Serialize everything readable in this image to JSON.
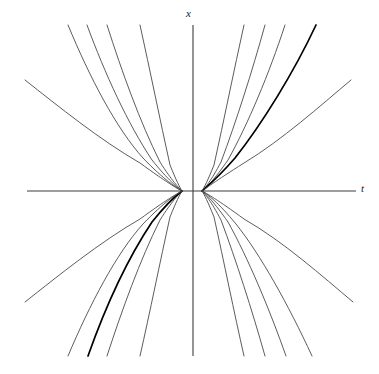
{
  "figure": {
    "title": "",
    "background_color": "#ffffff",
    "width": 379,
    "height": 374
  },
  "axes": {
    "vertical": {
      "label": "x",
      "name": "vertical-axis",
      "x": 193,
      "y_top": 25,
      "y_bottom": 356,
      "color": "#3c3c3c",
      "width": 1.1
    },
    "horizontal": {
      "label": "t",
      "name": "horizontal-axis",
      "y": 191,
      "x_left": 27,
      "x_right": 356,
      "color": "#3c3c3c",
      "width": 1.1
    },
    "origin": {
      "t": 0,
      "x": 0
    }
  },
  "chart_data": {
    "type": "line",
    "title": "",
    "xlabel": "t",
    "ylabel": "x",
    "grid": false,
    "legend": null,
    "pinch_points": [
      {
        "name": "left-pinch",
        "px": 182,
        "py": 191
      },
      {
        "name": "right-pinch",
        "px": 202,
        "py": 191
      }
    ],
    "axis_ranges": {
      "xlim": [
        -4.0,
        4.0
      ],
      "ylim": [
        -4.0,
        4.0
      ]
    },
    "series": [
      {
        "name": "curve-ul-1",
        "quadrant": "upper-left",
        "emphasis": false,
        "c": 0.3,
        "path": "M 140,25 C 150,70 160,120 170,165 C 176,180 180,188 182,191"
      },
      {
        "name": "curve-ul-2",
        "quadrant": "upper-left",
        "emphasis": false,
        "c": 0.55,
        "path": "M 107,25 C 122,72 140,122 160,162 C 172,181 179,188 182,191"
      },
      {
        "name": "curve-ul-3",
        "quadrant": "upper-left",
        "emphasis": false,
        "c": 0.8,
        "path": "M 87,25 C 105,74 128,124 152,160 C 168,180 178,188 182,191"
      },
      {
        "name": "curve-ul-4",
        "quadrant": "upper-left",
        "emphasis": false,
        "c": 1.1,
        "path": "M 68,25 C 90,78 116,128 143,158 C 164,180 177,188 182,191"
      },
      {
        "name": "curve-ul-5",
        "quadrant": "upper-left",
        "emphasis": false,
        "c": 1.9,
        "path": "M 25,80 C 58,106 100,140 140,163 C 166,182 178,189 182,191"
      },
      {
        "name": "curve-ur-1",
        "quadrant": "upper-right",
        "emphasis": false,
        "c": 0.3,
        "path": "M 244,25 C 234,70 224,120 214,165 C 208,180 204,188 202,191"
      },
      {
        "name": "curve-ur-2",
        "quadrant": "upper-right",
        "emphasis": false,
        "c": 0.55,
        "path": "M 265,25 C 252,72 236,122 221,162 C 211,181 205,188 202,191"
      },
      {
        "name": "curve-ur-3",
        "quadrant": "upper-right",
        "emphasis": false,
        "c": 0.8,
        "path": "M 285,25 C 269,74 248,124 228,160 C 214,180 206,188 202,191"
      },
      {
        "name": "curve-ur-4",
        "quadrant": "upper-right",
        "emphasis": true,
        "c": 1.05,
        "path": "M 316,25 C 294,72 262,124 235,158 C 216,180 205,188 202,191"
      },
      {
        "name": "curve-ur-5",
        "quadrant": "upper-right",
        "emphasis": false,
        "c": 1.9,
        "path": "M 351,80 C 320,106 282,140 244,163 C 214,182 205,189 202,191"
      },
      {
        "name": "curve-ll-1",
        "quadrant": "lower-left",
        "emphasis": false,
        "c": 0.3,
        "path": "M 182,191 C 180,194 176,202 170,217 C 160,262 150,312 140,356"
      },
      {
        "name": "curve-ll-2",
        "quadrant": "lower-left",
        "emphasis": false,
        "c": 0.55,
        "path": "M 182,191 C 179,194 172,201 160,220 C 140,260 122,310 107,356"
      },
      {
        "name": "curve-ll-3",
        "quadrant": "lower-left",
        "emphasis": true,
        "c": 0.78,
        "path": "M 182,191 C 178,194 168,202 152,222 C 128,258 105,308 88,356"
      },
      {
        "name": "curve-ll-4",
        "quadrant": "lower-left",
        "emphasis": false,
        "c": 1.1,
        "path": "M 182,191 C 177,194 164,202 143,224 C 116,254 90,304 68,356"
      },
      {
        "name": "curve-ll-5",
        "quadrant": "lower-left",
        "emphasis": false,
        "c": 1.9,
        "path": "M 182,191 C 178,193 166,200 140,219 C 100,242 58,276 25,302"
      },
      {
        "name": "curve-lr-1",
        "quadrant": "lower-right",
        "emphasis": false,
        "c": 0.3,
        "path": "M 202,191 C 204,194 208,202 214,217 C 224,262 234,312 244,356"
      },
      {
        "name": "curve-lr-2",
        "quadrant": "lower-right",
        "emphasis": false,
        "c": 0.55,
        "path": "M 202,191 C 205,194 211,201 221,220 C 236,260 252,310 265,356"
      },
      {
        "name": "curve-lr-3",
        "quadrant": "lower-right",
        "emphasis": false,
        "c": 0.8,
        "path": "M 202,191 C 206,194 214,202 228,222 C 248,258 269,308 286,356"
      },
      {
        "name": "curve-lr-4",
        "quadrant": "lower-right",
        "emphasis": false,
        "c": 1.1,
        "path": "M 202,191 C 207,194 218,202 236,224 C 260,254 288,304 312,356"
      },
      {
        "name": "curve-lr-5",
        "quadrant": "lower-right",
        "emphasis": false,
        "c": 1.9,
        "path": "M 202,191 C 206,193 218,200 244,219 C 284,242 322,276 353,302"
      }
    ],
    "style": {
      "curve_color": "#4a4a4a",
      "curve_emphasis_color": "#000000",
      "curve_width": 0.9,
      "curve_emphasis_width": 1.7
    }
  }
}
